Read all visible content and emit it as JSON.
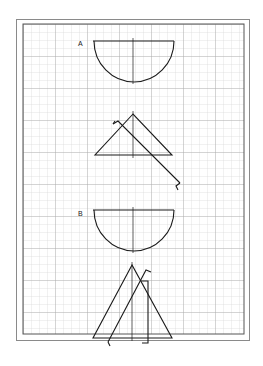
{
  "figure": {
    "type": "drafting-grid-diagram",
    "labels": {
      "a": "A",
      "b": "B"
    },
    "colors": {
      "ink": "#1a1a1a",
      "grid_minor": "#c8c8c8",
      "grid_major": "#9a9a9a",
      "frame": "#8a8a8a",
      "paper": "#ffffff"
    },
    "figures": [
      {
        "id": "A",
        "shapes": [
          "semicircle",
          "triangle-with-rotation-arrow"
        ]
      },
      {
        "id": "B",
        "shapes": [
          "semicircle",
          "triangle-with-translated-copy"
        ]
      }
    ]
  }
}
